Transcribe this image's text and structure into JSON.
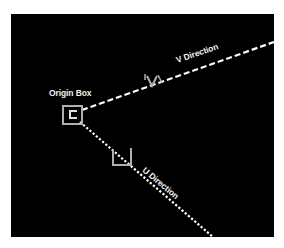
{
  "diagram": {
    "labels": {
      "origin_box": "Origin Box",
      "v_direction": "V Direction",
      "u_direction": "U Direction"
    },
    "colors": {
      "background": "#000000",
      "line": "#ffffff",
      "marker": "#b0b0b0",
      "page": "#ffffff"
    }
  }
}
